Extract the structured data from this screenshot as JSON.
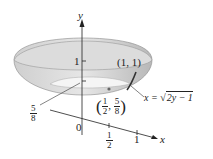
{
  "figure": {
    "type": "solid-of-revolution",
    "axes": {
      "y_label": "y",
      "x_label": "x",
      "origin_label": "0"
    },
    "y_ticks": [
      {
        "label": "1"
      },
      {
        "label_num": "5",
        "label_den": "8"
      }
    ],
    "x_ticks": [
      {
        "label_num": "1",
        "label_den": "2"
      },
      {
        "label": "1"
      }
    ],
    "points": [
      {
        "label": "(1, 1)"
      },
      {
        "label_num_x": "1",
        "label_den_x": "2",
        "label_num_y": "5",
        "label_den_y": "8"
      }
    ],
    "curve": {
      "lhs": "x = ",
      "sqrt_arg": "2y − 1"
    },
    "colors": {
      "surface": "#d9d9d9",
      "surface_dark": "#b5b5b5",
      "inner": "#f2f2f2",
      "line": "#222222"
    }
  }
}
